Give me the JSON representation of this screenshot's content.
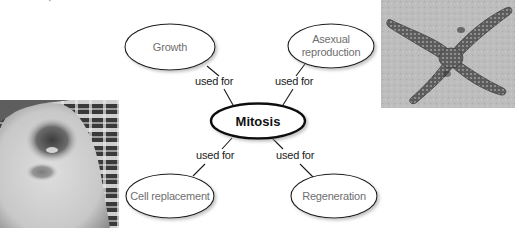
{
  "diagram": {
    "type": "concept-map",
    "center": {
      "label": "Mitosis",
      "cx": 258,
      "cy": 121,
      "rx": 48,
      "ry": 18
    },
    "nodes": [
      {
        "id": "growth",
        "label": "Growth",
        "cx": 170,
        "cy": 47,
        "rx": 45,
        "ry": 23
      },
      {
        "id": "asexual",
        "label": "Asexual reproduction",
        "line1": "Asexual",
        "line2": "reproduction",
        "cx": 331,
        "cy": 46,
        "rx": 43,
        "ry": 22
      },
      {
        "id": "cell-replacement",
        "label": "Cell replacement",
        "cx": 170,
        "cy": 196,
        "rx": 44,
        "ry": 22
      },
      {
        "id": "regeneration",
        "label": "Regeneration",
        "cx": 334,
        "cy": 196,
        "rx": 43,
        "ry": 22
      }
    ],
    "edges": [
      {
        "from": "mitosis",
        "to": "growth",
        "label": "used for"
      },
      {
        "from": "mitosis",
        "to": "asexual",
        "label": "used for"
      },
      {
        "from": "mitosis",
        "to": "cell-replacement",
        "label": "used for"
      },
      {
        "from": "mitosis",
        "to": "regeneration",
        "label": "used for"
      }
    ],
    "colors": {
      "ellipse_stroke": "#1a1a1a",
      "ellipse_fill": "#ffffff",
      "node_text": "#6f6f6f",
      "center_text": "#111111",
      "link_text": "#1a1a1a",
      "shadow": "#c8c8c8"
    }
  },
  "photos": [
    {
      "id": "knee",
      "subject": "scraped knee healing (cell replacement)"
    },
    {
      "id": "starfish",
      "subject": "starfish (regeneration / asexual reproduction)"
    }
  ]
}
